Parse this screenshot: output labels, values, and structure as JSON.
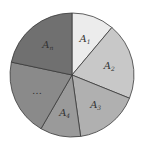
{
  "chart_data": {
    "type": "pie",
    "title": "",
    "categories": [
      "A1",
      "A2",
      "A3",
      "A4",
      "...",
      "An"
    ],
    "labels": [
      {
        "base": "A",
        "sub": "1"
      },
      {
        "base": "A",
        "sub": "2"
      },
      {
        "base": "A",
        "sub": "3"
      },
      {
        "base": "A",
        "sub": "4"
      },
      {
        "base": "…",
        "sub": ""
      },
      {
        "base": "A",
        "sub": "n"
      }
    ],
    "values": [
      40,
      72,
      60,
      38,
      72,
      78
    ],
    "colors": [
      "#ececec",
      "#c8c8c8",
      "#b0b0b0",
      "#9a9a9a",
      "#8a8a8a",
      "#707070"
    ],
    "start_angle_deg": 0,
    "direction": "clockwise",
    "legend": "none"
  }
}
